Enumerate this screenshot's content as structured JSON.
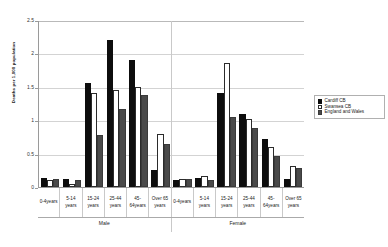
{
  "chart_data": {
    "type": "bar",
    "title": "",
    "xlabel": "",
    "ylabel": "Deaths per 1,000 population",
    "ylim": [
      0,
      2.5
    ],
    "ytick_labels": [
      "0",
      "0.5",
      "1",
      "1.5",
      "2",
      "2.5"
    ],
    "ytick_values": [
      0,
      0.5,
      1,
      1.5,
      2,
      2.5
    ],
    "grid": true,
    "legend_position": "right",
    "group_labels": [
      "Male",
      "Female"
    ],
    "categories": [
      "0-4years",
      "5-14 years",
      "15-24 years",
      "25-44 years",
      "45-64years",
      "Over 65 years",
      "0-4years",
      "5-14 years",
      "15-24 years",
      "25-44 years",
      "45-64years",
      "Over 65 years"
    ],
    "series": [
      {
        "name": "Cardiff CB",
        "color": "#0d0d0d",
        "values": [
          0.13,
          0.12,
          1.55,
          2.2,
          1.9,
          0.25,
          0.1,
          0.13,
          1.4,
          1.1,
          0.72,
          0.12
        ]
      },
      {
        "name": "Swansea CB",
        "color": "#ffffff",
        "values": [
          0.1,
          0.04,
          1.41,
          1.45,
          1.5,
          0.8,
          0.12,
          0.16,
          1.85,
          1.02,
          0.6,
          0.32
        ]
      },
      {
        "name": "England and Wales",
        "color": "#4a4a4a",
        "values": [
          0.12,
          0.1,
          0.78,
          1.17,
          1.38,
          0.65,
          0.12,
          0.1,
          1.05,
          0.88,
          0.46,
          0.28
        ]
      }
    ]
  },
  "legend": {
    "items": [
      {
        "label": "Cardiff CB"
      },
      {
        "label": "Swansea CB"
      },
      {
        "label": "England and Wales"
      }
    ]
  }
}
